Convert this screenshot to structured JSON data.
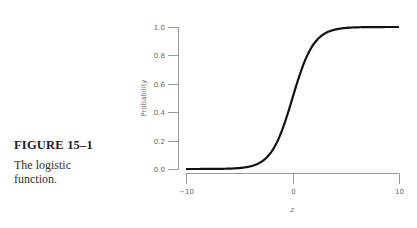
{
  "caption": {
    "figure_number": "FIGURE 15–1",
    "text_line1": "The logistic",
    "text_line2": "function."
  },
  "chart_data": {
    "type": "line",
    "title": "The logistic function",
    "xlabel": "z",
    "ylabel": "Probability",
    "xlim": [
      -10,
      10
    ],
    "ylim": [
      0,
      1
    ],
    "x_ticks": [
      "−10",
      "0",
      "10"
    ],
    "y_ticks": [
      "0.0",
      "0.2",
      "0.4",
      "0.6",
      "0.8",
      "1.0"
    ],
    "grid": false,
    "series": [
      {
        "name": "logistic",
        "x": [
          -10,
          -8,
          -6,
          -4,
          -3,
          -2,
          -1,
          0,
          1,
          2,
          3,
          4,
          6,
          8,
          10
        ],
        "values": [
          0.0,
          0.0003,
          0.0025,
          0.018,
          0.047,
          0.119,
          0.269,
          0.5,
          0.731,
          0.881,
          0.953,
          0.982,
          0.9975,
          0.9997,
          1.0
        ]
      }
    ],
    "colors": {
      "curve": "#111111",
      "axis": "#999999",
      "text": "#666666"
    }
  }
}
